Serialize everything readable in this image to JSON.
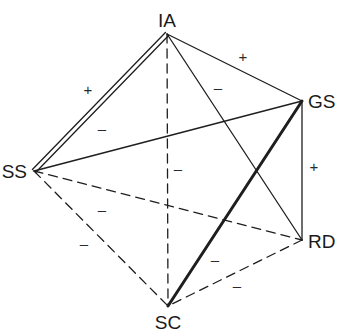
{
  "diagram": {
    "type": "signed-relationship-graph",
    "nodes": [
      {
        "id": "IA",
        "label": "IA",
        "x": 167,
        "y": 34,
        "label_x": 167,
        "label_y": 27,
        "anchor": "middle"
      },
      {
        "id": "GS",
        "label": "GS",
        "x": 302,
        "y": 101,
        "label_x": 308,
        "label_y": 108,
        "anchor": "start"
      },
      {
        "id": "SS",
        "label": "SS",
        "x": 34,
        "y": 171,
        "label_x": 27,
        "label_y": 178,
        "anchor": "end"
      },
      {
        "id": "RD",
        "label": "RD",
        "x": 302,
        "y": 240,
        "label_x": 308,
        "label_y": 248,
        "anchor": "start"
      },
      {
        "id": "SC",
        "label": "SC",
        "x": 168,
        "y": 306,
        "label_x": 168,
        "label_y": 329,
        "anchor": "middle"
      }
    ],
    "edges": [
      {
        "from": "IA",
        "to": "SS",
        "style": "double",
        "sign": "+",
        "sign_x": 88,
        "sign_y": 95
      },
      {
        "from": "IA",
        "to": "GS",
        "style": "solid",
        "sign": "+",
        "sign_x": 243,
        "sign_y": 62
      },
      {
        "from": "IA",
        "to": "RD",
        "style": "solid",
        "sign": "–",
        "sign_x": 218,
        "sign_y": 93
      },
      {
        "from": "IA",
        "to": "SC",
        "style": "dashed",
        "sign": "–",
        "sign_x": 178,
        "sign_y": 174
      },
      {
        "from": "SS",
        "to": "GS",
        "style": "solid",
        "sign": "–",
        "sign_x": 102,
        "sign_y": 134
      },
      {
        "from": "GS",
        "to": "RD",
        "style": "solid",
        "sign": "+",
        "sign_x": 314,
        "sign_y": 172
      },
      {
        "from": "GS",
        "to": "SC",
        "style": "bold",
        "sign": "–",
        "sign_x": 215,
        "sign_y": 265
      },
      {
        "from": "SS",
        "to": "RD",
        "style": "dashed",
        "sign": "–",
        "sign_x": 102,
        "sign_y": 215
      },
      {
        "from": "SS",
        "to": "SC",
        "style": "dashed",
        "sign": "–",
        "sign_x": 84,
        "sign_y": 249
      },
      {
        "from": "RD",
        "to": "SC",
        "style": "dashed",
        "sign": "–",
        "sign_x": 237,
        "sign_y": 291
      }
    ],
    "colors": {
      "line": "#1e1e1e",
      "text": "#1a1a1a",
      "background": "#ffffff"
    }
  }
}
